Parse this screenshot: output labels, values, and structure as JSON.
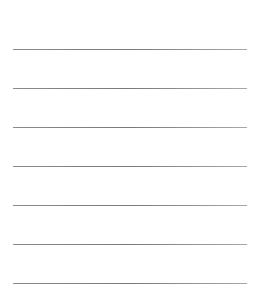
{
  "page": {
    "background": "#ffffff",
    "line_color": "#808080",
    "lines": [
      {
        "y": 49
      },
      {
        "y": 88
      },
      {
        "y": 127
      },
      {
        "y": 166
      },
      {
        "y": 205
      },
      {
        "y": 244
      },
      {
        "y": 283
      }
    ]
  }
}
